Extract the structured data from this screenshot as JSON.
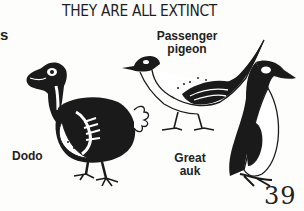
{
  "page": {
    "title": "THEY ARE ALL EXTINCT",
    "edge_fragment": "s",
    "page_number": "39"
  },
  "illustrations": [
    {
      "name": "dodo",
      "label": "Dodo"
    },
    {
      "name": "passenger-pigeon",
      "label_line1": "Passenger",
      "label_line2": "pigeon"
    },
    {
      "name": "great-auk",
      "label_line1": "Great",
      "label_line2": "auk"
    }
  ],
  "colors": {
    "ink": "#1a1a1a",
    "paper": "#fdfdfc"
  }
}
